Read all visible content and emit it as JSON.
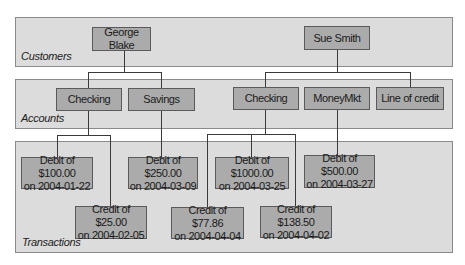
{
  "bands": {
    "customers": {
      "label": "Customers"
    },
    "accounts": {
      "label": "Accounts"
    },
    "transactions": {
      "label": "Transactions"
    }
  },
  "customers": [
    {
      "name": "George Blake"
    },
    {
      "name": "Sue Smith"
    }
  ],
  "accounts": [
    {
      "name": "Checking",
      "owner": "George Blake"
    },
    {
      "name": "Savings",
      "owner": "George Blake"
    },
    {
      "name": "Checking",
      "owner": "Sue Smith"
    },
    {
      "name": "MoneyMkt",
      "owner": "Sue Smith"
    },
    {
      "name": "Line of credit",
      "owner": "Sue Smith"
    }
  ],
  "transactions": [
    {
      "text": "Debit of $100.00\non 2004-01-22",
      "account": "Checking (George Blake)"
    },
    {
      "text": "Credit of $25.00\non 2004-02-05",
      "account": "Checking (George Blake)"
    },
    {
      "text": "Debit of $250.00\non 2004-03-09",
      "account": "Savings"
    },
    {
      "text": "Debit of $1000.00\non 2004-03-25",
      "account": "Checking (Sue Smith)"
    },
    {
      "text": "Credit of $77.86\non 2004-04-04",
      "account": "Checking (Sue Smith)"
    },
    {
      "text": "Credit of $138.50\non 2004-04-02",
      "account": "Checking (Sue Smith)"
    },
    {
      "text": "Debit of $500.00\non 2004-03-27",
      "account": "MoneyMkt"
    }
  ],
  "colors": {
    "band_fill": "#dcdcdc",
    "band_border": "#8a8a8a",
    "node_fill": "#ababab",
    "node_border": "#5a5a5a",
    "connector": "#3a3a3a"
  }
}
